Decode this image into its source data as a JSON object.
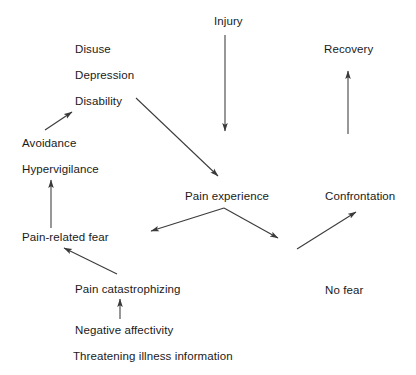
{
  "figure": {
    "type": "diagram",
    "kind": "fear-avoidance-model-flow-diagram",
    "background_color": "#ffffff",
    "line_color": "#3a3a3a",
    "text_color": "#1a1a1a"
  },
  "nodes": [
    {
      "id": "injury",
      "label": "Injury",
      "x": 214,
      "y": 15
    },
    {
      "id": "disuse",
      "label": "Disuse",
      "x": 75,
      "y": 43
    },
    {
      "id": "recovery",
      "label": "Recovery",
      "x": 324,
      "y": 43
    },
    {
      "id": "depression",
      "label": "Depression",
      "x": 75,
      "y": 69
    },
    {
      "id": "disability",
      "label": "Disability",
      "x": 75,
      "y": 95
    },
    {
      "id": "avoidance",
      "label": "Avoidance",
      "x": 22,
      "y": 137
    },
    {
      "id": "hypervigilance",
      "label": "Hypervigilance",
      "x": 22,
      "y": 163
    },
    {
      "id": "pain-experience",
      "label": "Pain experience",
      "x": 185,
      "y": 190
    },
    {
      "id": "confrontation",
      "label": "Confrontation",
      "x": 325,
      "y": 190
    },
    {
      "id": "pain-related-fear",
      "label": "Pain-related fear",
      "x": 22,
      "y": 231
    },
    {
      "id": "no-fear",
      "label": "No fear",
      "x": 325,
      "y": 284
    },
    {
      "id": "pain-catastrophizing",
      "label": "Pain catastrophizing",
      "x": 75,
      "y": 283
    },
    {
      "id": "negative-affectivity",
      "label": "Negative affectivity",
      "x": 75,
      "y": 324
    },
    {
      "id": "threatening-illness-information",
      "label": "Threatening illness information",
      "x": 73,
      "y": 350
    }
  ],
  "edges": [
    {
      "id": "injury-to-pain-experience",
      "from": "injury",
      "to": "pain-experience",
      "x1": 225,
      "y1": 35,
      "x2": 225,
      "y2": 131
    },
    {
      "id": "disability-to-pain-experience",
      "from": "disability",
      "to": "pain-experience",
      "x1": 136,
      "y1": 98,
      "x2": 218,
      "y2": 176
    },
    {
      "id": "avoidance-to-disability",
      "from": "avoidance",
      "to": "disability",
      "x1": 45,
      "y1": 130,
      "x2": 72,
      "y2": 112
    },
    {
      "id": "pain-related-fear-to-hypervigilance",
      "from": "pain-related-fear",
      "to": "hypervigilance",
      "x1": 51,
      "y1": 228,
      "x2": 51,
      "y2": 180
    },
    {
      "id": "pain-experience-to-pain-related-fear",
      "from": "pain-experience",
      "to": "pain-related-fear",
      "x1": 224,
      "y1": 208,
      "x2": 151,
      "y2": 231
    },
    {
      "id": "pain-experience-to-no-fear",
      "from": "pain-experience",
      "to": "no-fear",
      "x1": 224,
      "y1": 208,
      "x2": 278,
      "y2": 238
    },
    {
      "id": "no-fear-to-confrontation",
      "from": "no-fear",
      "to": "confrontation",
      "x1": 297,
      "y1": 249,
      "x2": 356,
      "y2": 212
    },
    {
      "id": "pain-catastrophizing-to-pain-related-fear",
      "from": "pain-catastrophizing",
      "to": "pain-related-fear",
      "x1": 117,
      "y1": 274,
      "x2": 64,
      "y2": 248
    },
    {
      "id": "negative-affectivity-to-pain-catastrophizing",
      "from": "negative-affectivity",
      "to": "pain-catastrophizing",
      "x1": 120,
      "y1": 319,
      "x2": 120,
      "y2": 299
    },
    {
      "id": "confrontation-to-recovery",
      "from": "confrontation",
      "to": "recovery",
      "x1": 348,
      "y1": 134,
      "x2": 348,
      "y2": 71
    }
  ]
}
